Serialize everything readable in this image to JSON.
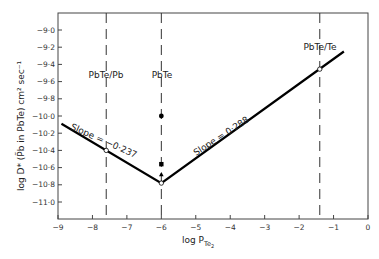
{
  "chart_data": {
    "type": "line",
    "title": "",
    "xlabel": "log P_Te2",
    "xlabel_main": "log P",
    "xlabel_sub": "Te",
    "xlabel_subsub": "2",
    "ylabel": "log D* (P̃b in PbTe) cm² sec⁻¹",
    "xlim": [
      -9,
      0
    ],
    "ylim": [
      -11.2,
      -8.8
    ],
    "grid": false,
    "x_ticks": [
      -9,
      -8,
      -7,
      -6,
      -5,
      -4,
      -3,
      -2,
      -1,
      0
    ],
    "x_tick_labels": [
      "-9",
      "-8",
      "-7",
      "-6",
      "-5",
      "-4",
      "-3",
      "-2",
      "-1",
      "0"
    ],
    "y_ticks": [
      -9.0,
      -9.2,
      -9.4,
      -9.6,
      -9.8,
      -10.0,
      -10.2,
      -10.4,
      -10.6,
      -10.8,
      -11.0
    ],
    "y_tick_labels": [
      "-9·0",
      "-9·2",
      "-9·4",
      "-9·6",
      "-9·8",
      "-10·0",
      "-10·2",
      "-10·4",
      "-10·6",
      "-10·8",
      "-11·0"
    ],
    "series": [
      {
        "name": "Fitted line",
        "style": "solid",
        "x": [
          -8.9,
          -6.0,
          -0.7
        ],
        "y": [
          -10.09,
          -10.78,
          -9.25
        ]
      }
    ],
    "points": [
      {
        "name": "open-circle-PbTe-Pb",
        "marker": "open-circle",
        "x": -7.6,
        "y": -10.4
      },
      {
        "name": "open-circle-PbTe",
        "marker": "open-circle",
        "x": -6.0,
        "y": -10.78
      },
      {
        "name": "open-circle-PbTe-Te",
        "marker": "open-circle",
        "x": -1.4,
        "y": -9.455
      },
      {
        "name": "filled-circle",
        "marker": "filled-circle",
        "x": -6.0,
        "y": -10.0
      },
      {
        "name": "filled-square",
        "marker": "filled-square",
        "x": -6.0,
        "y": -10.56
      },
      {
        "name": "filled-triangle",
        "marker": "filled-triangle",
        "x": -6.0,
        "y": -10.68
      }
    ],
    "vertical_lines": [
      {
        "label": "PbTe/Pb",
        "x": -7.6,
        "style": "dashed"
      },
      {
        "label": "PbTe",
        "x": -6.0,
        "style": "dashed"
      },
      {
        "label": "PbTe/Te",
        "x": -1.4,
        "style": "dashed"
      }
    ],
    "annotations": [
      {
        "text": "Slope = −0·237",
        "x": -7.9,
        "y": -10.22,
        "angle": 23
      },
      {
        "text": "Slope = 0·288",
        "x": -3.6,
        "y": -10.05,
        "angle": -32
      }
    ]
  },
  "labels": {
    "region_pbte_pb": "PbTe/Pb",
    "region_pbte": "PbTe",
    "region_pbte_te": "PbTe/Te",
    "slope_left": "Slope = −0·237",
    "slope_right": "Slope = 0·288"
  }
}
